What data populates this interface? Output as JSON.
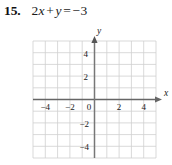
{
  "exercise": {
    "number": "15.",
    "equation": {
      "full": "2x + y = -3",
      "coefficient_x": "2",
      "var_x": "x",
      "plus": "+",
      "var_y": "y",
      "equals": "=",
      "right_side": "−3"
    }
  },
  "graph": {
    "x_axis_label": "x",
    "y_axis_label": "y",
    "x_tick_labels": [
      "−4",
      "−2",
      "0",
      "2",
      "4"
    ],
    "y_tick_labels": [
      "4",
      "2",
      "−2",
      "−4"
    ],
    "origin_label": "0",
    "x_range": [
      -5,
      5
    ],
    "y_range": [
      -5,
      5
    ],
    "grid": "on",
    "grid_color": "#cfcfcf",
    "axis_color": "#555555",
    "background": "#ffffff",
    "plotted_line": "none"
  }
}
